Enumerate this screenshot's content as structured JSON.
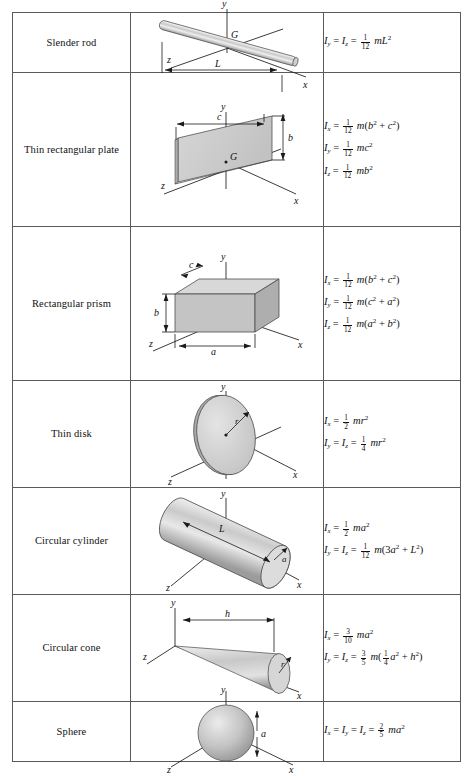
{
  "table": {
    "title": "Mass Moments of Inertia of Common Geometric Shapes",
    "columns": [
      "Body",
      "Figure",
      "Moments of inertia"
    ],
    "rows": [
      {
        "name": "Slender rod",
        "figure": "slender-rod",
        "figure_labels": [
          "y",
          "G",
          "z",
          "L",
          "x"
        ],
        "equations": [
          {
            "lhs": "I",
            "lhs_sub": "y",
            "eq2_lhs": "I",
            "eq2_sub": "z",
            "num": "1",
            "den": "12",
            "rhs": "mL",
            "rhs_sup": "2"
          }
        ],
        "equations_text": [
          "I_y = I_z = (1/12) m L^2"
        ]
      },
      {
        "name": "Thin rectangular plate",
        "figure": "thin-rectangular-plate",
        "figure_labels": [
          "y",
          "c",
          "b",
          "G",
          "z",
          "x"
        ],
        "equations_text": [
          "I_x = (1/12) m(b^2 + c^2)",
          "I_y = (1/12) m c^2",
          "I_z = (1/12) m b^2"
        ]
      },
      {
        "name": "Rectangular prism",
        "figure": "rectangular-prism",
        "figure_labels": [
          "y",
          "c",
          "b",
          "z",
          "a",
          "x"
        ],
        "equations_text": [
          "I_x = (1/12) m(b^2 + c^2)",
          "I_y = (1/12) m(c^2 + a^2)",
          "I_z = (1/12) m(a^2 + b^2)"
        ]
      },
      {
        "name": "Thin disk",
        "figure": "thin-disk",
        "figure_labels": [
          "y",
          "r",
          "z",
          "x"
        ],
        "equations_text": [
          "I_x = (1/2) m r^2",
          "I_y = I_z = (1/4) m r^2"
        ]
      },
      {
        "name": "Circular cylinder",
        "figure": "circular-cylinder",
        "figure_labels": [
          "y",
          "L",
          "a",
          "z",
          "x"
        ],
        "equations_text": [
          "I_x = (1/2) m a^2",
          "I_y = I_z = (1/12) m(3a^2 + L^2)"
        ]
      },
      {
        "name": "Circular cone",
        "figure": "circular-cone",
        "figure_labels": [
          "y",
          "h",
          "r",
          "z",
          "x"
        ],
        "equations_text": [
          "I_x = (3/10) m a^2",
          "I_y = I_z = (3/5) m((1/4)a^2 + h^2)"
        ]
      },
      {
        "name": "Sphere",
        "figure": "sphere",
        "figure_labels": [
          "y",
          "a",
          "z",
          "x"
        ],
        "equations_text": [
          "I_x = I_y = I_z = (2/5) m a^2"
        ]
      }
    ]
  },
  "symbols": {
    "I": "I",
    "m": "m",
    "x": "x",
    "y": "y",
    "z": "z",
    "G": "G",
    "a": "a",
    "b": "b",
    "c": "c",
    "h": "h",
    "r": "r",
    "L": "L",
    "equals": "=",
    "plus": "+",
    "sup2": "2"
  },
  "fractions": {
    "one_twelfth": {
      "n": "1",
      "d": "12"
    },
    "one_half": {
      "n": "1",
      "d": "2"
    },
    "one_quarter": {
      "n": "1",
      "d": "4"
    },
    "three_tenths": {
      "n": "3",
      "d": "10"
    },
    "three_fifths": {
      "n": "3",
      "d": "5"
    },
    "two_fifths": {
      "n": "2",
      "d": "5"
    }
  },
  "colors": {
    "page_background": "#ffffff",
    "border": "#5a5a5a",
    "text": "#111111",
    "shape_light": "#f0f0f0",
    "shape_mid": "#d2d2d2",
    "shape_dark": "#b4b4b4"
  }
}
